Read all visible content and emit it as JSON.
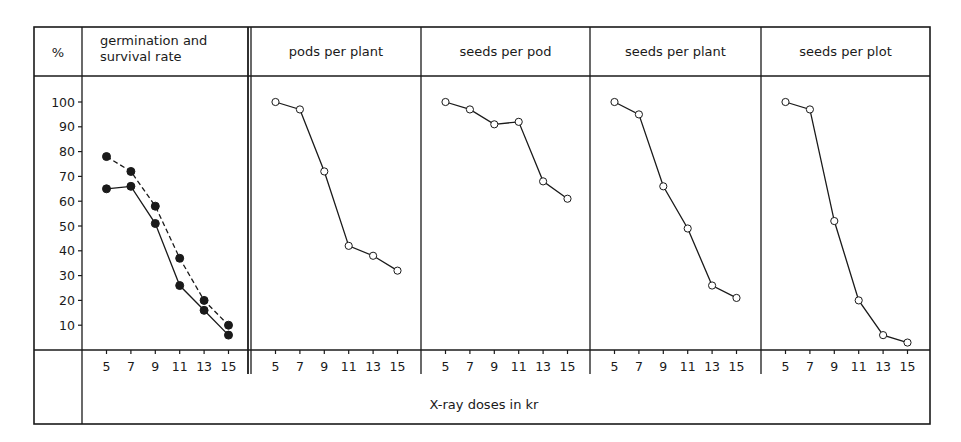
{
  "figure": {
    "corner_label": "%",
    "x_axis_label": "X-ray doses in kr",
    "line_color": "#1a1a1a",
    "background": "#ffffff"
  },
  "chart_data": {
    "type": "line",
    "layout": "five side-by-side panels sharing a y-axis, table-style frame",
    "ylabel": "%",
    "xlabel": "X-ray doses in kr",
    "ylim": [
      0,
      100
    ],
    "yticks": [
      10,
      20,
      30,
      40,
      50,
      60,
      70,
      80,
      90,
      100
    ],
    "x": [
      5,
      7,
      9,
      11,
      13,
      15
    ],
    "xtick_labels": [
      "5",
      "7",
      "9",
      "11",
      "13",
      "15"
    ],
    "grid": false,
    "legend": "none",
    "panels": [
      {
        "title": "germination and survival rate",
        "title_lines": [
          "germination and",
          "survival rate"
        ],
        "series": [
          {
            "name": "germination rate",
            "style": "dashed",
            "marker": "filled-circle",
            "values": [
              78,
              72,
              58,
              37,
              20,
              10
            ]
          },
          {
            "name": "survival rate",
            "style": "solid",
            "marker": "filled-circle",
            "values": [
              65,
              66,
              51,
              26,
              16,
              6
            ]
          }
        ]
      },
      {
        "title": "pods per plant",
        "title_lines": [
          "pods per plant"
        ],
        "series": [
          {
            "name": "pods per plant",
            "style": "solid",
            "marker": "open-circle",
            "values": [
              100,
              97,
              72,
              42,
              38,
              32
            ]
          }
        ]
      },
      {
        "title": "seeds per pod",
        "title_lines": [
          "seeds per pod"
        ],
        "series": [
          {
            "name": "seeds per pod",
            "style": "solid",
            "marker": "open-circle",
            "values": [
              100,
              97,
              91,
              92,
              68,
              61
            ]
          }
        ]
      },
      {
        "title": "seeds per plant",
        "title_lines": [
          "seeds per plant"
        ],
        "series": [
          {
            "name": "seeds per plant",
            "style": "solid",
            "marker": "open-circle",
            "values": [
              100,
              95,
              66,
              49,
              26,
              21
            ]
          }
        ]
      },
      {
        "title": "seeds per plot",
        "title_lines": [
          "seeds per plot"
        ],
        "series": [
          {
            "name": "seeds per plot",
            "style": "solid",
            "marker": "open-circle",
            "values": [
              100,
              97,
              52,
              20,
              6,
              3
            ]
          }
        ]
      }
    ]
  }
}
